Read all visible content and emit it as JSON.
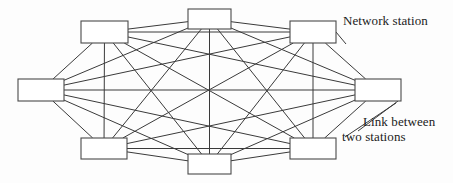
{
  "figure": {
    "type": "network-topology-diagram",
    "topology": "full-mesh",
    "width": 453,
    "height": 183,
    "background_color": "#fdfdfd",
    "line_color": "#3a3a3a",
    "box_fill_color": "#ffffff",
    "box_stroke_color": "#4a4a4a"
  },
  "annotations": {
    "network_station": "Network station",
    "link_line_1": "Link between",
    "link_line_2": "two stations"
  },
  "chart_data": {
    "type": "diagram",
    "title": "",
    "node_count": 8,
    "edge_count": 28,
    "nodes": [
      {
        "id": "n0",
        "label": "",
        "x": 81,
        "y": 21,
        "w": 47,
        "h": 22,
        "position": "top-left"
      },
      {
        "id": "n1",
        "label": "",
        "x": 188,
        "y": 9,
        "w": 43,
        "h": 20,
        "position": "top-center"
      },
      {
        "id": "n2",
        "label": "",
        "x": 290,
        "y": 21,
        "w": 46,
        "h": 22,
        "position": "top-right"
      },
      {
        "id": "n3",
        "label": "",
        "x": 355,
        "y": 79,
        "w": 46,
        "h": 22,
        "position": "middle-right"
      },
      {
        "id": "n4",
        "label": "",
        "x": 290,
        "y": 138,
        "w": 46,
        "h": 21,
        "position": "bottom-right"
      },
      {
        "id": "n5",
        "label": "",
        "x": 188,
        "y": 154,
        "w": 43,
        "h": 20,
        "position": "bottom-center"
      },
      {
        "id": "n6",
        "label": "",
        "x": 81,
        "y": 138,
        "w": 46,
        "h": 21,
        "position": "bottom-left"
      },
      {
        "id": "n7",
        "label": "",
        "x": 18,
        "y": 79,
        "w": 46,
        "h": 22,
        "position": "middle-left"
      }
    ],
    "edges": [
      [
        "n0",
        "n1"
      ],
      [
        "n0",
        "n2"
      ],
      [
        "n0",
        "n3"
      ],
      [
        "n0",
        "n4"
      ],
      [
        "n0",
        "n5"
      ],
      [
        "n0",
        "n6"
      ],
      [
        "n0",
        "n7"
      ],
      [
        "n1",
        "n2"
      ],
      [
        "n1",
        "n3"
      ],
      [
        "n1",
        "n4"
      ],
      [
        "n1",
        "n5"
      ],
      [
        "n1",
        "n6"
      ],
      [
        "n1",
        "n7"
      ],
      [
        "n2",
        "n3"
      ],
      [
        "n2",
        "n4"
      ],
      [
        "n2",
        "n5"
      ],
      [
        "n2",
        "n6"
      ],
      [
        "n2",
        "n7"
      ],
      [
        "n3",
        "n4"
      ],
      [
        "n3",
        "n5"
      ],
      [
        "n3",
        "n6"
      ],
      [
        "n3",
        "n7"
      ],
      [
        "n4",
        "n5"
      ],
      [
        "n4",
        "n6"
      ],
      [
        "n4",
        "n7"
      ],
      [
        "n5",
        "n6"
      ],
      [
        "n5",
        "n7"
      ],
      [
        "n6",
        "n7"
      ]
    ],
    "leaders": [
      {
        "name": "network-station-leader",
        "x1": 336,
        "y1": 32,
        "x2": 346,
        "y2": 44
      },
      {
        "name": "link-leader-a",
        "x1": 398,
        "y1": 101,
        "x2": 358,
        "y2": 131
      },
      {
        "name": "link-leader-b",
        "x1": 396,
        "y1": 103,
        "x2": 345,
        "y2": 137
      }
    ]
  }
}
